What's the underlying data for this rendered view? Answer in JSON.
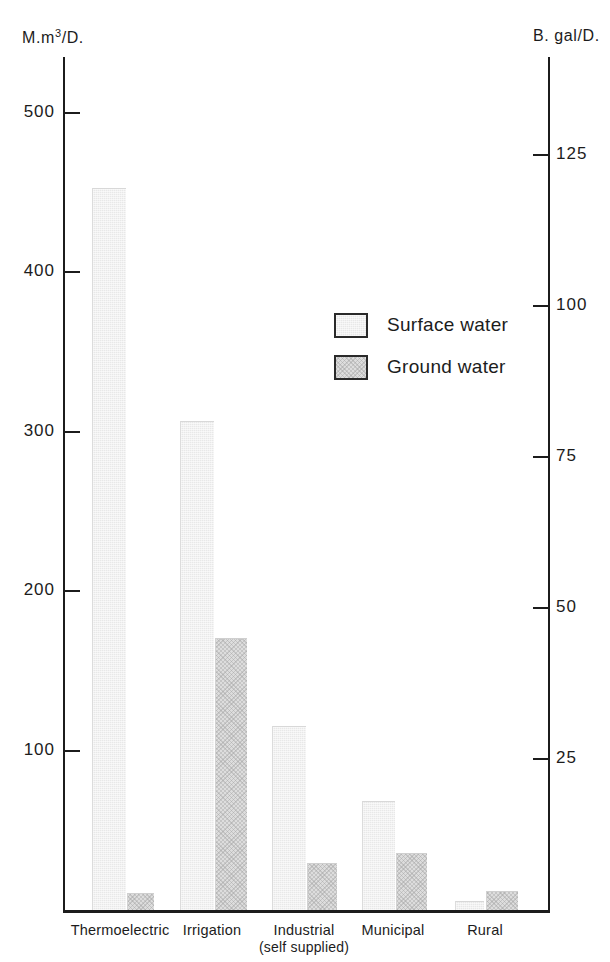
{
  "chart_data": {
    "type": "bar",
    "title": "",
    "subtitle": "",
    "categories": [
      "Thermoelectric",
      "Irrigation",
      "Industrial (self supplied)",
      "Municipal",
      "Rural"
    ],
    "category_labels": [
      {
        "line1": "Thermoelectric",
        "line2": ""
      },
      {
        "line1": "Irrigation",
        "line2": ""
      },
      {
        "line1": "Industrial",
        "line2": "(self supplied)"
      },
      {
        "line1": "Municipal",
        "line2": ""
      },
      {
        "line1": "Rural",
        "line2": ""
      }
    ],
    "series": [
      {
        "name": "Surface water",
        "values": [
          452,
          306,
          115,
          68,
          5
        ],
        "color": "#e8e8e8"
      },
      {
        "name": "Ground water",
        "values": [
          10,
          170,
          29,
          35,
          11
        ],
        "color": "#dddddd"
      }
    ],
    "legend": [
      "Surface water",
      "Ground water"
    ],
    "legend_position": "inside-upper-center",
    "xlabel": "",
    "ylabel": "M.m³/D.",
    "y2label": "B. gal/D.",
    "ylim": [
      0,
      535
    ],
    "y2lim": [
      0,
      141.3
    ],
    "yticks": [
      100,
      200,
      300,
      400,
      500
    ],
    "ytick_labels": [
      "100",
      "200",
      "300",
      "400",
      "500"
    ],
    "y2ticks": [
      25,
      50,
      75,
      100,
      125
    ],
    "y2tick_labels": [
      "25",
      "50",
      "75",
      "100",
      "125"
    ],
    "grid": false
  },
  "axes": {
    "left_unit_prefix": "M.m",
    "left_unit_exponent": "3",
    "left_unit_suffix": "/D.",
    "right_unit": "B. gal/D."
  },
  "legend": {
    "items": [
      {
        "label": "Surface water",
        "swatch": "surface-water-swatch"
      },
      {
        "label": "Ground water",
        "swatch": "ground-water-swatch"
      }
    ]
  }
}
